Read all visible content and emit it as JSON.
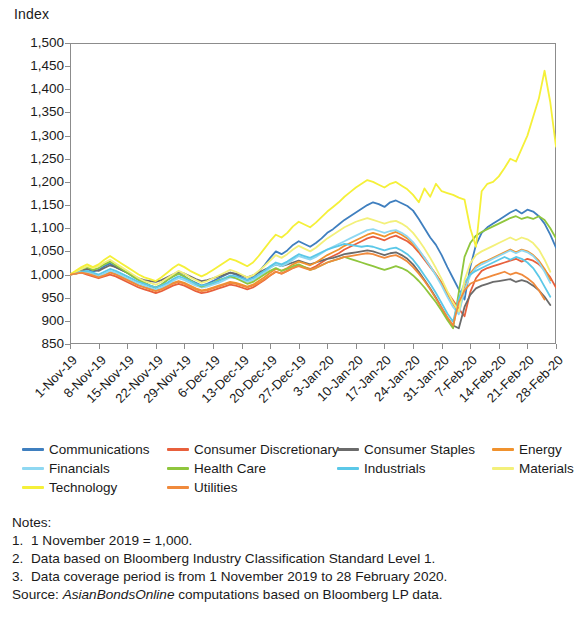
{
  "chart_data": {
    "type": "line",
    "title": "",
    "ylabel": "Index",
    "xlabel": "",
    "ylim": [
      850,
      1500
    ],
    "ytick_step": 50,
    "yticks": [
      "1,500",
      "1,450",
      "1,400",
      "1,350",
      "1,300",
      "1,250",
      "1,200",
      "1,150",
      "1,100",
      "1,050",
      "1,000",
      "950",
      "900",
      "850"
    ],
    "grid": false,
    "legend_position": "below-axis",
    "x_tick_labels": [
      "1-Nov-19",
      "8-Nov-19",
      "15-Nov-19",
      "22-Nov-19",
      "29-Nov-19",
      "6-Dec-19",
      "13-Dec-19",
      "20-Dec-19",
      "27-Dec-19",
      "3-Jan-20",
      "10-Jan-20",
      "17-Jan-20",
      "24-Jan-20",
      "31-Jan-20",
      "7-Feb-20",
      "14-Feb-20",
      "21-Feb-20",
      "28-Feb-20"
    ],
    "x_count": 86,
    "series": [
      {
        "name": "Communications",
        "color": "#3f7fbf",
        "values": [
          1000,
          1004,
          1008,
          1012,
          1006,
          1010,
          1018,
          1024,
          1016,
          1010,
          1004,
          996,
          988,
          982,
          976,
          972,
          978,
          988,
          996,
          1002,
          996,
          988,
          982,
          976,
          980,
          986,
          992,
          998,
          1004,
          1000,
          994,
          988,
          994,
          1006,
          1020,
          1036,
          1050,
          1044,
          1052,
          1064,
          1072,
          1066,
          1060,
          1068,
          1078,
          1090,
          1098,
          1108,
          1118,
          1126,
          1134,
          1142,
          1150,
          1156,
          1152,
          1146,
          1156,
          1160,
          1154,
          1148,
          1138,
          1120,
          1100,
          1080,
          1064,
          1042,
          1016,
          992,
          968,
          946,
          1016,
          1064,
          1090,
          1102,
          1110,
          1118,
          1126,
          1134,
          1140,
          1132,
          1140,
          1136,
          1126,
          1110,
          1086,
          1058
        ]
      },
      {
        "name": "Consumer Discretionary",
        "color": "#e8603c",
        "values": [
          1000,
          1002,
          1004,
          1000,
          996,
          992,
          996,
          1000,
          996,
          990,
          984,
          978,
          972,
          968,
          964,
          960,
          964,
          970,
          976,
          980,
          976,
          970,
          964,
          960,
          962,
          966,
          970,
          974,
          978,
          976,
          972,
          968,
          972,
          980,
          988,
          998,
          1006,
          1002,
          1008,
          1014,
          1020,
          1016,
          1012,
          1018,
          1026,
          1034,
          1040,
          1046,
          1054,
          1060,
          1066,
          1072,
          1078,
          1082,
          1078,
          1074,
          1080,
          1084,
          1078,
          1072,
          1062,
          1048,
          1032,
          1016,
          1000,
          982,
          962,
          944,
          926,
          910,
          962,
          992,
          1008,
          1014,
          1018,
          1022,
          1026,
          1030,
          1034,
          1028,
          1034,
          1030,
          1022,
          1010,
          994,
          972
        ]
      },
      {
        "name": "Consumer Staples",
        "color": "#6b6b6b",
        "values": [
          1000,
          1004,
          1008,
          1012,
          1010,
          1008,
          1014,
          1020,
          1016,
          1010,
          1004,
          998,
          992,
          988,
          986,
          984,
          988,
          994,
          1000,
          1006,
          1002,
          996,
          990,
          986,
          988,
          992,
          996,
          1000,
          1004,
          1002,
          998,
          994,
          998,
          1004,
          1010,
          1016,
          1022,
          1018,
          1022,
          1026,
          1030,
          1026,
          1022,
          1026,
          1030,
          1034,
          1036,
          1040,
          1044,
          1046,
          1048,
          1050,
          1052,
          1050,
          1046,
          1042,
          1046,
          1048,
          1042,
          1034,
          1022,
          1006,
          988,
          970,
          950,
          928,
          906,
          890,
          884,
          930,
          956,
          970,
          976,
          980,
          984,
          986,
          988,
          990,
          984,
          988,
          984,
          976,
          966,
          952,
          934
        ]
      },
      {
        "name": "Energy",
        "color": "#f0922e",
        "values": [
          1000,
          1002,
          1006,
          1004,
          1000,
          996,
          1000,
          1006,
          1002,
          996,
          990,
          984,
          978,
          974,
          970,
          966,
          970,
          976,
          982,
          986,
          982,
          976,
          970,
          966,
          968,
          972,
          976,
          980,
          984,
          982,
          978,
          974,
          978,
          986,
          994,
          1004,
          1012,
          1008,
          1014,
          1022,
          1028,
          1024,
          1020,
          1026,
          1034,
          1042,
          1048,
          1054,
          1062,
          1068,
          1074,
          1080,
          1086,
          1090,
          1086,
          1082,
          1088,
          1092,
          1086,
          1078,
          1066,
          1052,
          1036,
          1018,
          1000,
          980,
          958,
          936,
          918,
          970,
          1002,
          1018,
          1026,
          1030,
          1036,
          1042,
          1048,
          1054,
          1048,
          1054,
          1050,
          1042,
          1030,
          1012,
          988
        ]
      },
      {
        "name": "Financials",
        "color": "#8fd8f2",
        "values": [
          1000,
          1004,
          1006,
          1004,
          1000,
          996,
          1002,
          1008,
          1004,
          998,
          992,
          986,
          980,
          976,
          972,
          968,
          972,
          978,
          986,
          992,
          988,
          982,
          976,
          972,
          974,
          978,
          982,
          988,
          994,
          992,
          988,
          984,
          988,
          996,
          1004,
          1014,
          1022,
          1018,
          1024,
          1032,
          1040,
          1036,
          1032,
          1038,
          1046,
          1054,
          1060,
          1066,
          1072,
          1078,
          1084,
          1090,
          1096,
          1098,
          1094,
          1090,
          1094,
          1096,
          1090,
          1082,
          1070,
          1054,
          1036,
          1018,
          998,
          976,
          952,
          930,
          914,
          966,
          998,
          1014,
          1022,
          1028,
          1034,
          1040,
          1046,
          1052,
          1046,
          1052,
          1048,
          1040,
          1026,
          1006,
          982
        ]
      },
      {
        "name": "Health Care",
        "color": "#8fc63d",
        "values": [
          1000,
          1006,
          1012,
          1016,
          1010,
          1014,
          1022,
          1028,
          1020,
          1012,
          1004,
          996,
          988,
          982,
          976,
          972,
          978,
          988,
          996,
          1002,
          996,
          988,
          980,
          974,
          978,
          982,
          988,
          992,
          996,
          992,
          986,
          980,
          984,
          992,
          1000,
          1008,
          1014,
          1008,
          1012,
          1018,
          1022,
          1016,
          1010,
          1014,
          1020,
          1026,
          1030,
          1034,
          1038,
          1034,
          1030,
          1026,
          1022,
          1018,
          1014,
          1010,
          1014,
          1018,
          1014,
          1008,
          998,
          986,
          972,
          956,
          940,
          922,
          902,
          884,
          962,
          1038,
          1068,
          1084,
          1092,
          1098,
          1104,
          1110,
          1116,
          1122,
          1126,
          1120,
          1124,
          1120,
          1126,
          1118,
          1100,
          1078
        ]
      },
      {
        "name": "Industrials",
        "color": "#5bc8e8",
        "values": [
          1000,
          1002,
          1006,
          1008,
          1004,
          1000,
          1006,
          1012,
          1008,
          1002,
          996,
          990,
          984,
          980,
          976,
          972,
          976,
          982,
          990,
          996,
          992,
          986,
          980,
          976,
          978,
          982,
          986,
          992,
          998,
          996,
          992,
          988,
          992,
          1000,
          1008,
          1018,
          1026,
          1022,
          1028,
          1036,
          1044,
          1040,
          1036,
          1042,
          1048,
          1054,
          1058,
          1062,
          1066,
          1064,
          1062,
          1060,
          1062,
          1060,
          1056,
          1052,
          1056,
          1058,
          1052,
          1044,
          1032,
          1016,
          998,
          980,
          960,
          938,
          916,
          898,
          948,
          982,
          1000,
          1008,
          1014,
          1020,
          1026,
          1032,
          1038,
          1032,
          1038,
          1034,
          1026,
          1014,
          996,
          974,
          952
        ]
      },
      {
        "name": "Materials",
        "color": "#f3f07a",
        "values": [
          1000,
          1006,
          1012,
          1018,
          1014,
          1018,
          1026,
          1032,
          1024,
          1016,
          1008,
          1000,
          992,
          986,
          982,
          978,
          984,
          992,
          1000,
          1008,
          1002,
          994,
          988,
          982,
          986,
          992,
          998,
          1004,
          1010,
          1006,
          1000,
          994,
          998,
          1008,
          1018,
          1030,
          1042,
          1036,
          1044,
          1054,
          1062,
          1056,
          1050,
          1058,
          1068,
          1078,
          1086,
          1094,
          1102,
          1108,
          1114,
          1118,
          1122,
          1118,
          1114,
          1110,
          1114,
          1116,
          1110,
          1102,
          1090,
          1074,
          1056,
          1036,
          1014,
          990,
          964,
          940,
          920,
          988,
          1024,
          1042,
          1050,
          1056,
          1062,
          1068,
          1074,
          1080,
          1074,
          1080,
          1076,
          1068,
          1054,
          1032,
          1006
        ]
      },
      {
        "name": "Technology",
        "color": "#f5f039",
        "values": [
          1000,
          1008,
          1016,
          1022,
          1016,
          1022,
          1032,
          1040,
          1032,
          1024,
          1016,
          1008,
          1000,
          994,
          990,
          986,
          994,
          1004,
          1014,
          1022,
          1016,
          1008,
          1002,
          996,
          1002,
          1010,
          1018,
          1026,
          1034,
          1030,
          1024,
          1018,
          1026,
          1040,
          1056,
          1072,
          1086,
          1080,
          1090,
          1104,
          1114,
          1108,
          1102,
          1112,
          1124,
          1136,
          1146,
          1156,
          1168,
          1178,
          1188,
          1196,
          1204,
          1200,
          1194,
          1188,
          1196,
          1200,
          1192,
          1184,
          1172,
          1156,
          1186,
          1168,
          1196,
          1180,
          1176,
          1172,
          1166,
          1162,
          1100,
          1060,
          1180,
          1196,
          1200,
          1212,
          1230,
          1250,
          1244,
          1272,
          1300,
          1340,
          1380,
          1440,
          1372,
          1276
        ]
      },
      {
        "name": "Utilities",
        "color": "#f08a3c",
        "values": [
          1000,
          1002,
          1004,
          1002,
          998,
          994,
          998,
          1004,
          1000,
          994,
          988,
          982,
          976,
          972,
          968,
          964,
          968,
          974,
          980,
          984,
          980,
          974,
          968,
          964,
          966,
          970,
          974,
          978,
          982,
          980,
          976,
          972,
          976,
          982,
          990,
          998,
          1006,
          1002,
          1008,
          1014,
          1018,
          1014,
          1010,
          1014,
          1020,
          1026,
          1030,
          1034,
          1038,
          1040,
          1042,
          1044,
          1046,
          1044,
          1040,
          1036,
          1040,
          1042,
          1036,
          1028,
          1016,
          1002,
          986,
          968,
          948,
          928,
          908,
          890,
          940,
          966,
          980,
          986,
          990,
          994,
          998,
          1002,
          1006,
          1000,
          1004,
          1000,
          992,
          982,
          966,
          946
        ]
      }
    ]
  },
  "legend": {
    "rows": [
      [
        {
          "label": "Communications",
          "color": "#3f7fbf"
        },
        {
          "label": "Consumer Discretionary",
          "color": "#e8603c"
        },
        {
          "label": "Consumer Staples",
          "color": "#6b6b6b"
        },
        {
          "label": "Energy",
          "color": "#f0922e"
        }
      ],
      [
        {
          "label": "Financials",
          "color": "#8fd8f2"
        },
        {
          "label": "Health Care",
          "color": "#8fc63d"
        },
        {
          "label": "Industrials",
          "color": "#5bc8e8"
        },
        {
          "label": "Materials",
          "color": "#f3f07a"
        }
      ],
      [
        {
          "label": "Technology",
          "color": "#f5f039"
        },
        {
          "label": "Utilities",
          "color": "#f08a3c"
        }
      ]
    ]
  },
  "notes": {
    "heading": "Notes:",
    "items": [
      {
        "num": "1.",
        "text": "1 November 2019 = 1,000."
      },
      {
        "num": "2.",
        "text": "Data based on Bloomberg Industry Classification Standard Level 1."
      },
      {
        "num": "3.",
        "text": "Data coverage period is from 1 November 2019 to 28 February 2020."
      }
    ],
    "source_prefix": "Source: ",
    "source_em": "AsianBondsOnline",
    "source_rest": " computations based on Bloomberg LP data."
  }
}
